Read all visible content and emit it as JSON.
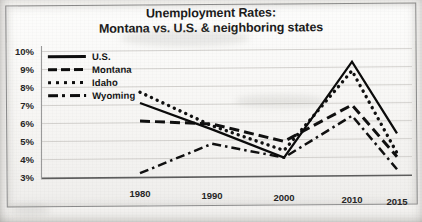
{
  "chart_data": {
    "type": "line",
    "title": "Unemployment Rates:",
    "subtitle": "Montana vs. U.S. & neighboring states",
    "xlabel": "",
    "ylabel": "",
    "categories": [
      "1980",
      "1990",
      "2000",
      "2010",
      "2015"
    ],
    "x": [
      1980,
      1990,
      2000,
      2010,
      2015
    ],
    "ylim": [
      3,
      10
    ],
    "yticks": [
      "3%",
      "4%",
      "5%",
      "6%",
      "7%",
      "8%",
      "9%",
      "10%"
    ],
    "ytick_values": [
      3,
      4,
      5,
      6,
      7,
      8,
      9,
      10
    ],
    "grid": true,
    "legend_position": "top-left",
    "series": [
      {
        "name": "U.S.",
        "style": "solid",
        "color": "#0d0d0d",
        "values": [
          7.1,
          5.6,
          4.0,
          9.3,
          5.3
        ]
      },
      {
        "name": "Montana",
        "style": "dashed",
        "color": "#0d0d0d",
        "values": [
          6.1,
          5.9,
          4.9,
          6.9,
          4.0
        ]
      },
      {
        "name": "Idaho",
        "style": "dotted",
        "color": "#0d0d0d",
        "values": [
          7.7,
          5.8,
          4.4,
          8.8,
          4.2
        ]
      },
      {
        "name": "Wyoming",
        "style": "dash-dot",
        "color": "#0d0d0d",
        "values": [
          3.2,
          4.8,
          4.0,
          6.3,
          3.3
        ]
      }
    ]
  },
  "chart": {
    "title_line1": "Unemployment Rates:",
    "title_line2": "Montana vs. U.S. & neighboring states",
    "ytick_labels": [
      "10%",
      "9%",
      "8%",
      "7%",
      "6%",
      "5%",
      "4%",
      "3%"
    ],
    "xtick_labels": [
      "1980",
      "1990",
      "2000",
      "2010",
      "2015"
    ],
    "legend": [
      {
        "label": "U.S.",
        "key": "solid-line-key"
      },
      {
        "label": "Montana",
        "key": "dashed-line-key"
      },
      {
        "label": "Idaho",
        "key": "dotted-line-key"
      },
      {
        "label": "Wyoming",
        "key": "dash-dot-line-key"
      }
    ]
  }
}
